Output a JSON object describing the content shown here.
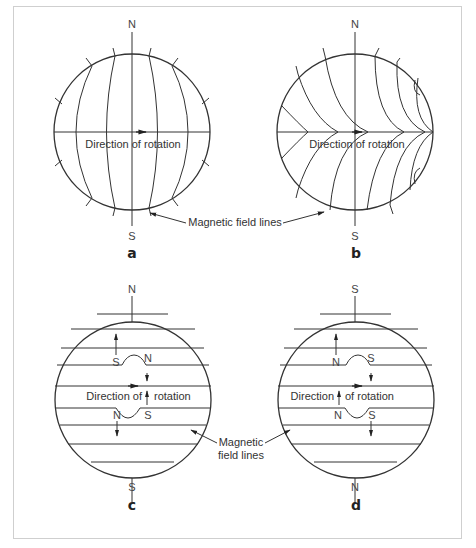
{
  "figure": {
    "panels": [
      {
        "id": "a",
        "letter": "a",
        "top_pole": "N",
        "bottom_pole": "S",
        "rotation_label": "Direction of rotation",
        "field_line_style": "meridional (pole-to-pole)"
      },
      {
        "id": "b",
        "letter": "b",
        "top_pole": "N",
        "bottom_pole": "S",
        "rotation_label": "Direction of rotation",
        "field_line_style": "wound / sheared by differential rotation"
      },
      {
        "id": "c",
        "letter": "c",
        "top_pole": "N",
        "bottom_pole": "S",
        "rotation_label_left": "Direction of",
        "rotation_label_right": "rotation",
        "bipole_upper": {
          "left": "S",
          "right": "N"
        },
        "bipole_lower": {
          "left": "N",
          "right": "S"
        },
        "field_line_style": "toroidal (east-west)"
      },
      {
        "id": "d",
        "letter": "d",
        "top_pole": "S",
        "bottom_pole": "N",
        "rotation_label_left": "Direction",
        "rotation_label_right": "of rotation",
        "bipole_upper": {
          "left": "N",
          "right": "S"
        },
        "bipole_lower": {
          "left": "N",
          "right": "S"
        },
        "field_line_style": "toroidal (east-west), reversed polarity"
      }
    ],
    "callouts": {
      "top": "Magnetic field lines",
      "bottom_line1": "Magnetic",
      "bottom_line2": "field lines"
    }
  }
}
